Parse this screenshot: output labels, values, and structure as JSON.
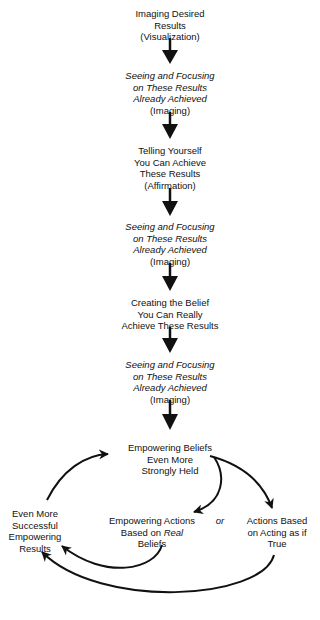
{
  "diagram": {
    "linear_steps": [
      {
        "lines": [
          "Imaging Desired",
          "Results",
          "(Visualization)"
        ],
        "italic_lines": 0
      },
      {
        "lines": [
          "Seeing and Focusing",
          "on These Results",
          "Already Achieved",
          "(Imaging)"
        ],
        "italic_lines": 3
      },
      {
        "lines": [
          "Telling Yourself",
          "You Can Achieve",
          "These Results",
          "(Affirmation)"
        ],
        "italic_lines": 0
      },
      {
        "lines": [
          "Seeing and Focusing",
          "on These Results",
          "Already Achieved",
          "(Imaging)"
        ],
        "italic_lines": 3
      },
      {
        "lines": [
          "Creating the Belief",
          "You Can Really",
          "Achieve These Results"
        ],
        "italic_lines": 0
      },
      {
        "lines": [
          "Seeing and Focusing",
          "on These Results",
          "Already Achieved",
          "(Imaging)"
        ],
        "italic_lines": 3
      }
    ],
    "cycle": {
      "beliefs": [
        "Empowering Beliefs",
        "Even More",
        "Strongly Held"
      ],
      "results": [
        "Even More",
        "Successful",
        "Empowering",
        "Results"
      ],
      "real_actions": {
        "line1": "Empowering Actions",
        "line2_prefix": "Based on ",
        "line2_italic": "Real",
        "line3": "Beliefs"
      },
      "or_label": "or",
      "acting_actions": [
        "Actions Based",
        "on Acting as if",
        "True"
      ]
    },
    "arrows": [
      {
        "from": "Imaging Desired Results",
        "to": "Seeing and Focusing (1)"
      },
      {
        "from": "Seeing and Focusing (1)",
        "to": "Telling Yourself"
      },
      {
        "from": "Telling Yourself",
        "to": "Seeing and Focusing (2)"
      },
      {
        "from": "Seeing and Focusing (2)",
        "to": "Creating the Belief"
      },
      {
        "from": "Creating the Belief",
        "to": "Seeing and Focusing (3)"
      },
      {
        "from": "Seeing and Focusing (3)",
        "to": "Empowering Beliefs"
      },
      {
        "from": "Empowering Beliefs",
        "to": "Empowering Actions"
      },
      {
        "from": "Empowering Beliefs",
        "to": "Actions Based on Acting as if True"
      },
      {
        "from": "Empowering Actions",
        "to": "Even More Successful Empowering Results"
      },
      {
        "from": "Actions Based on Acting as if True",
        "to": "Even More Successful Empowering Results"
      },
      {
        "from": "Even More Successful Empowering Results",
        "to": "Empowering Beliefs"
      }
    ],
    "colors": {
      "ink": "#111111",
      "background": "#ffffff"
    }
  }
}
